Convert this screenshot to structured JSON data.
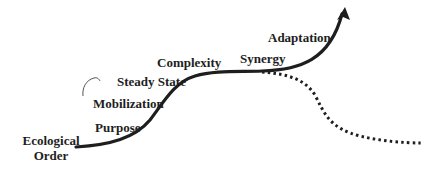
{
  "diagram": {
    "type": "growth curve",
    "colors": {
      "line": "#1e1e1e",
      "background": "#ffffff"
    },
    "labels": {
      "ecological_order_line1": "Ecological",
      "ecological_order_line2": "Order",
      "purpose": "Purpose",
      "mobilization": "Mobilization",
      "steady_state": "Steady State",
      "complexity": "Complexity",
      "synergy": "Synergy",
      "adaptation": "Adaptation"
    },
    "paths": {
      "solid_curve": "rising S-curve ending in upward arrow",
      "dotted_curve": "declining dotted branch after Synergy"
    }
  }
}
